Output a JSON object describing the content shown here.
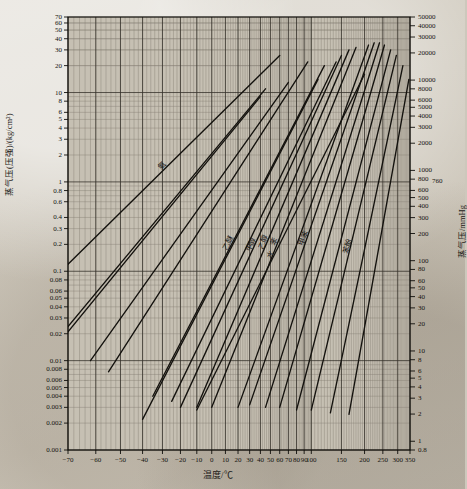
{
  "figure": {
    "kind": "cox-chart"
  },
  "axes": {
    "x": {
      "title": "温度/℃",
      "label_plain": "Temperature / degC",
      "min": -70,
      "max": 350,
      "scale": "cox-nonlinear",
      "ticks": [
        -70,
        -60,
        -50,
        -40,
        -30,
        -20,
        -10,
        0,
        10,
        20,
        30,
        40,
        50,
        60,
        70,
        80,
        90,
        100,
        150,
        200,
        250,
        300,
        350
      ]
    },
    "y_left": {
      "title": "蒸气压(压强)/(kg/cm²)",
      "label_plain": "Vapour pressure / (kg/cm2)",
      "scale": "log",
      "min": 0.001,
      "max": 70,
      "ticks": [
        70,
        60,
        50,
        40,
        30,
        20,
        10,
        8,
        6,
        5,
        4,
        3,
        2,
        1,
        0.8,
        0.6,
        0.4,
        0.3,
        0.2,
        0.1,
        0.08,
        0.06,
        0.05,
        0.04,
        0.03,
        0.02,
        0.01,
        0.008,
        0.006,
        0.005,
        0.004,
        0.003,
        0.002,
        0.001
      ]
    },
    "y_right": {
      "title": "蒸气压/mmHg",
      "label_plain": "Vapour pressure / mmHg",
      "scale": "log",
      "min": 0.8,
      "max": 50000,
      "ticks": [
        50000,
        40000,
        30000,
        20000,
        10000,
        8000,
        6000,
        5000,
        4000,
        3000,
        2000,
        1000,
        800,
        760,
        600,
        500,
        400,
        300,
        200,
        100,
        80,
        60,
        50,
        40,
        30,
        20,
        10,
        8,
        6,
        5,
        4,
        3,
        2,
        1,
        0.8
      ],
      "highlighted_tick": 760
    }
  },
  "grid": {
    "major_color": "#2a2620",
    "minor_color": "#6d665b",
    "enabled": true
  },
  "chart_data": {
    "type": "line",
    "title": "",
    "xlabel": "温度/℃",
    "ylabel": "蒸气压(压强)/(kg/cm²)",
    "xlim": [
      -70,
      350
    ],
    "ylim": [
      0.001,
      70
    ],
    "yscale": "log",
    "grid": true,
    "legend": "inline-rotated-labels",
    "series": [
      {
        "name": "line-01",
        "label": "氨",
        "x": [
          -70,
          60
        ],
        "y": [
          0.12,
          26
        ]
      },
      {
        "name": "line-02",
        "label": "",
        "x": [
          -70,
          40
        ],
        "y": [
          0.021,
          9.0
        ]
      },
      {
        "name": "line-03",
        "label": "",
        "x": [
          -70,
          45
        ],
        "y": [
          0.024,
          11.0
        ]
      },
      {
        "name": "line-04",
        "label": "",
        "x": [
          -62,
          70
        ],
        "y": [
          0.01,
          13.0
        ]
      },
      {
        "name": "line-05",
        "label": "",
        "x": [
          -55,
          95
        ],
        "y": [
          0.0075,
          22.0
        ]
      },
      {
        "name": "line-06",
        "label": "",
        "x": [
          -40,
          110
        ],
        "y": [
          0.0022,
          14.0
        ]
      },
      {
        "name": "line-07",
        "label": "乙醚",
        "x": [
          -35,
          120
        ],
        "y": [
          0.004,
          20.0
        ]
      },
      {
        "name": "line-08",
        "label": "",
        "x": [
          -25,
          140
        ],
        "y": [
          0.0035,
          22.0
        ]
      },
      {
        "name": "line-09",
        "label": "甲醇",
        "x": [
          -20,
          150
        ],
        "y": [
          0.003,
          26.0
        ]
      },
      {
        "name": "line-10",
        "label": "乙醇",
        "x": [
          -10,
          165
        ],
        "y": [
          0.003,
          30.0
        ]
      },
      {
        "name": "line-11",
        "label": "苯",
        "x": [
          0,
          180
        ],
        "y": [
          0.003,
          32.0
        ]
      },
      {
        "name": "line-12",
        "label": "水",
        "x": [
          -10,
          200
        ],
        "y": [
          0.0028,
          16.0
        ]
      },
      {
        "name": "line-13",
        "label": "",
        "x": [
          20,
          210
        ],
        "y": [
          0.003,
          34.0
        ]
      },
      {
        "name": "line-14",
        "label": "甲苯",
        "x": [
          30,
          225
        ],
        "y": [
          0.0032,
          36.0
        ]
      },
      {
        "name": "line-15",
        "label": "",
        "x": [
          45,
          240
        ],
        "y": [
          0.003,
          36.0
        ]
      },
      {
        "name": "line-16",
        "label": "",
        "x": [
          60,
          255
        ],
        "y": [
          0.003,
          34.0
        ]
      },
      {
        "name": "line-17",
        "label": "",
        "x": [
          80,
          275
        ],
        "y": [
          0.0028,
          30.0
        ]
      },
      {
        "name": "line-18",
        "label": "苯酚",
        "x": [
          100,
          295
        ],
        "y": [
          0.0028,
          26.0
        ]
      },
      {
        "name": "line-19",
        "label": "",
        "x": [
          130,
          320
        ],
        "y": [
          0.0026,
          20.0
        ]
      },
      {
        "name": "line-20",
        "label": "",
        "x": [
          165,
          345
        ],
        "y": [
          0.0025,
          14.0
        ]
      }
    ]
  }
}
